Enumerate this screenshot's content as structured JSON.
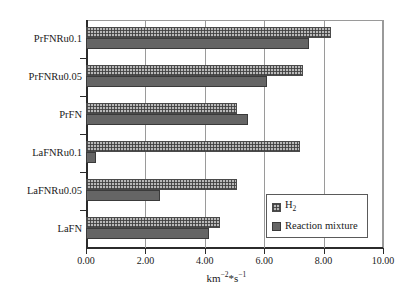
{
  "chart_data": {
    "type": "bar",
    "orientation": "horizontal",
    "title": "",
    "xlabel": "km⁻²*s⁻¹",
    "ylabel": "",
    "xlim": [
      0.0,
      10.0
    ],
    "xticks": [
      "0.00",
      "2.00",
      "4.00",
      "6.00",
      "8.00",
      "10.00"
    ],
    "xtick_values": [
      0,
      2,
      4,
      6,
      8,
      10
    ],
    "grid": true,
    "grid_axis": "x",
    "legend_position": "lower-right-inside",
    "categories": [
      "LaFN",
      "LaFNRu0.05",
      "LaFNRu0.1",
      "PrFN",
      "PrFNRu0.05",
      "PrFNRu0.1"
    ],
    "categories_top_to_bottom": [
      "PrFNRu0.1",
      "PrFNRu0.05",
      "PrFN",
      "LaFNRu0.1",
      "LaFNRu0.05",
      "LaFN"
    ],
    "series": [
      {
        "name": "H2",
        "label": "H",
        "label_sub": "2",
        "color": "#b9b9b9",
        "pattern": "dotted-grid",
        "values": [
          4.5,
          5.1,
          7.2,
          5.1,
          7.3,
          8.25
        ]
      },
      {
        "name": "Reaction mixture",
        "label": "Reaction mixture",
        "color": "#656565",
        "pattern": "solid",
        "values": [
          4.15,
          2.5,
          0.35,
          5.45,
          6.1,
          7.5
        ]
      }
    ]
  },
  "legend": {
    "items": [
      {
        "label": "H",
        "sub": "2"
      },
      {
        "label": "Reaction mixture",
        "sub": ""
      }
    ]
  },
  "axis": {
    "x_title_main": "km",
    "x_title_sup1": "−2",
    "x_title_mid": "*s",
    "x_title_sup2": "−1"
  }
}
